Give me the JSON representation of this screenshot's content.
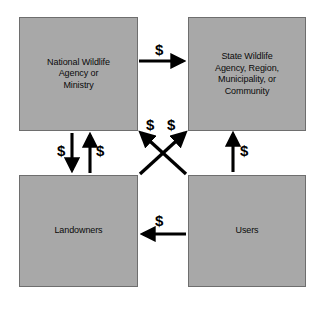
{
  "diagram": {
    "background_color": "#ffffff",
    "node_fill_color": "#a8a8a8",
    "node_border_color": "#6e6e6e",
    "arrow_color": "#000000",
    "nodes": [
      {
        "id": "national",
        "label": "National Wildlife\nAgency or\nMinistry"
      },
      {
        "id": "state",
        "label": "State Wildlife\nAgency, Region,\nMunicipality, or\nCommunity"
      },
      {
        "id": "landowners",
        "label": "Landowners"
      },
      {
        "id": "users",
        "label": "Users"
      }
    ],
    "flows": [
      {
        "id": "national-to-state",
        "from": "national",
        "to": "state",
        "label": "$",
        "direction": "right"
      },
      {
        "id": "national-to-landowners",
        "from": "national",
        "to": "landowners",
        "label": "$",
        "direction": "down"
      },
      {
        "id": "landowners-to-national",
        "from": "landowners",
        "to": "national",
        "label": "$",
        "direction": "up"
      },
      {
        "id": "landowners-to-state",
        "from": "landowners",
        "to": "state",
        "label": "$",
        "direction": "diagonal-up-right"
      },
      {
        "id": "users-to-national",
        "from": "users",
        "to": "national",
        "label": "$",
        "direction": "diagonal-up-left"
      },
      {
        "id": "users-to-state",
        "from": "users",
        "to": "state",
        "label": "$",
        "direction": "up"
      },
      {
        "id": "users-to-landowners",
        "from": "users",
        "to": "landowners",
        "label": "$",
        "direction": "left"
      }
    ],
    "labels": {
      "national_to_state": "$",
      "national_to_landowners": "$",
      "landowners_to_national": "$",
      "cross_left": "$",
      "cross_right": "$",
      "users_to_state": "$",
      "users_to_landowners": "$"
    }
  }
}
